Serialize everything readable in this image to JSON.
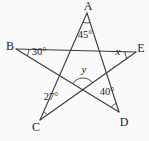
{
  "figure": {
    "colors": {
      "background": "#fafafa",
      "line": "#3a3a3a",
      "text": "#222222"
    },
    "vertices": {
      "A": "A",
      "B": "B",
      "C": "C",
      "D": "D",
      "E": "E"
    },
    "angles": {
      "at_A": "45°",
      "at_B": "30°",
      "at_C": "27°",
      "at_D": "40°",
      "at_E": "x",
      "at_intersection": "y"
    }
  }
}
